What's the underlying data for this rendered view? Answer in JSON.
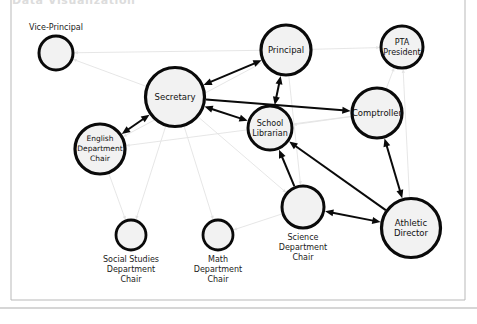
{
  "page": {
    "title": "Data Visualization",
    "background_color": "#ffffff",
    "frame_color": "#b9b9b9"
  },
  "diagram": {
    "type": "directed-network-graph",
    "node_fill": "#f2f2f2",
    "node_stroke": "#0a0a0a",
    "strong_edge_color": "#0a0a0a",
    "weak_edge_color": "#e3e3e3",
    "nodes": [
      {
        "id": "vice_principal",
        "label": "Vice-Principal",
        "lines": [
          "Vice-Principal"
        ],
        "x": 56,
        "y": 53,
        "r": 17,
        "stroke_width": 3,
        "label_position": "above",
        "font_size": 8
      },
      {
        "id": "secretary",
        "label": "Secretary",
        "lines": [
          "Secretary"
        ],
        "x": 175,
        "y": 97,
        "r": 29.5,
        "stroke_width": 3.2,
        "label_position": "inside",
        "font_size": 8.5
      },
      {
        "id": "principal",
        "label": "Principal",
        "lines": [
          "Principal"
        ],
        "x": 286,
        "y": 50,
        "r": 25,
        "stroke_width": 3.2,
        "label_position": "inside",
        "font_size": 8.5
      },
      {
        "id": "pta_president",
        "label": "PTA President",
        "lines": [
          "PTA",
          "President"
        ],
        "x": 402,
        "y": 47,
        "r": 21,
        "stroke_width": 3,
        "label_position": "inside",
        "font_size": 8
      },
      {
        "id": "comptroller",
        "label": "Comptroller",
        "lines": [
          "Comptroller"
        ],
        "x": 377,
        "y": 113,
        "r": 25,
        "stroke_width": 3.2,
        "label_position": "inside",
        "font_size": 8.5
      },
      {
        "id": "school_librarian",
        "label": "School Librarian",
        "lines": [
          "School",
          "Librarian"
        ],
        "x": 270,
        "y": 128,
        "r": 22,
        "stroke_width": 3,
        "label_position": "inside",
        "font_size": 8
      },
      {
        "id": "english_chair",
        "label": "English Department Chair",
        "lines": [
          "English",
          "Department",
          "Chair"
        ],
        "x": 100,
        "y": 149,
        "r": 25,
        "stroke_width": 3.2,
        "label_position": "inside",
        "font_size": 7.5
      },
      {
        "id": "athletic_director",
        "label": "Athletic Director",
        "lines": [
          "Athletic",
          "Director"
        ],
        "x": 411,
        "y": 228,
        "r": 29.5,
        "stroke_width": 3.2,
        "label_position": "inside",
        "font_size": 8.5
      },
      {
        "id": "science_chair",
        "label": "Science Department Chair",
        "lines": [
          "Science",
          "Department",
          "Chair"
        ],
        "x": 303,
        "y": 207,
        "r": 21,
        "stroke_width": 3,
        "label_position": "below",
        "font_size": 8
      },
      {
        "id": "social_studies_chair",
        "label": "Social Studies Department Chair",
        "lines": [
          "Social Studies",
          "Department",
          "Chair"
        ],
        "x": 131,
        "y": 235,
        "r": 15,
        "stroke_width": 2.8,
        "label_position": "below",
        "font_size": 8
      },
      {
        "id": "math_chair",
        "label": "Math Department Chair",
        "lines": [
          "Math",
          "Department",
          "Chair"
        ],
        "x": 218,
        "y": 235,
        "r": 15,
        "stroke_width": 2.8,
        "label_position": "below",
        "font_size": 8
      }
    ],
    "edges": [
      {
        "from": "principal",
        "to": "secretary",
        "weight": "strong",
        "arrows": "both"
      },
      {
        "from": "secretary",
        "to": "school_librarian",
        "weight": "strong",
        "arrows": "both"
      },
      {
        "from": "principal",
        "to": "school_librarian",
        "weight": "strong",
        "arrows": "both"
      },
      {
        "from": "secretary",
        "to": "english_chair",
        "weight": "strong",
        "arrows": "both"
      },
      {
        "from": "science_chair",
        "to": "school_librarian",
        "weight": "strong",
        "arrows": "to"
      },
      {
        "from": "science_chair",
        "to": "athletic_director",
        "weight": "strong",
        "arrows": "both"
      },
      {
        "from": "comptroller",
        "to": "athletic_director",
        "weight": "strong",
        "arrows": "both"
      },
      {
        "from": "secretary",
        "to": "comptroller",
        "weight": "strong",
        "arrows": "to"
      },
      {
        "from": "athletic_director",
        "to": "school_librarian",
        "weight": "strong",
        "arrows": "to"
      },
      {
        "from": "principal",
        "to": "vice_principal",
        "weight": "weak",
        "arrows": "to"
      },
      {
        "from": "secretary",
        "to": "vice_principal",
        "weight": "weak",
        "arrows": "to"
      },
      {
        "from": "principal",
        "to": "pta_president",
        "weight": "weak",
        "arrows": "to"
      },
      {
        "from": "comptroller",
        "to": "pta_president",
        "weight": "weak",
        "arrows": "to"
      },
      {
        "from": "athletic_director",
        "to": "pta_president",
        "weight": "weak",
        "arrows": "to"
      },
      {
        "from": "comptroller",
        "to": "secretary",
        "weight": "weak",
        "arrows": "to"
      },
      {
        "from": "comptroller",
        "to": "school_librarian",
        "weight": "weak",
        "arrows": "to"
      },
      {
        "from": "principal",
        "to": "english_chair",
        "weight": "weak",
        "arrows": "to"
      },
      {
        "from": "principal",
        "to": "science_chair",
        "weight": "weak",
        "arrows": "to"
      },
      {
        "from": "comptroller",
        "to": "english_chair",
        "weight": "weak",
        "arrows": "to"
      },
      {
        "from": "secretary",
        "to": "social_studies_chair",
        "weight": "weak",
        "arrows": "to"
      },
      {
        "from": "secretary",
        "to": "math_chair",
        "weight": "weak",
        "arrows": "to"
      },
      {
        "from": "secretary",
        "to": "science_chair",
        "weight": "weak",
        "arrows": "to"
      },
      {
        "from": "english_chair",
        "to": "social_studies_chair",
        "weight": "weak",
        "arrows": "to"
      },
      {
        "from": "science_chair",
        "to": "math_chair",
        "weight": "weak",
        "arrows": "to"
      },
      {
        "from": "athletic_director",
        "to": "comptroller",
        "weight": "weak",
        "arrows": "to"
      }
    ]
  }
}
